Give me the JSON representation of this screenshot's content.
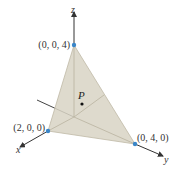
{
  "figure": {
    "type": "3d-plane-intercepts",
    "axes": {
      "x_label": "x",
      "y_label": "y",
      "z_label": "z"
    },
    "points": {
      "z_intercept": "(0, 0, 4)",
      "x_intercept": "(2, 0, 0)",
      "y_intercept": "(0, 4, 0)",
      "point_p": "P"
    },
    "colors": {
      "plane_fill": "#d8d4c4",
      "plane_edge": "#bfb9a6",
      "axis": "#333333",
      "vertex_dot": "#3a86c8",
      "point_dot": "#111111"
    }
  }
}
